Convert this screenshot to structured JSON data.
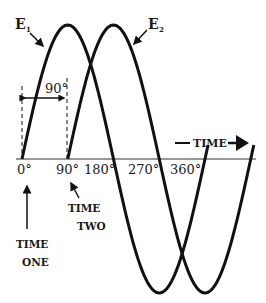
{
  "diagram": {
    "colors": {
      "line": "#111111",
      "background": "#ffffff"
    },
    "waves": [
      {
        "name": "E1",
        "label_main": "E",
        "label_sub": "1",
        "start_deg": 0
      },
      {
        "name": "E2",
        "label_main": "E",
        "label_sub": "2",
        "start_deg": 90
      }
    ],
    "phase_marker": {
      "label": "90°"
    },
    "axis": {
      "ticks": [
        "0°",
        "90°",
        "180°",
        "270°",
        "360°"
      ],
      "direction_label": "TIME"
    },
    "annotations": {
      "time_one": [
        "TIME",
        "ONE"
      ],
      "time_two": [
        "TIME",
        "TWO"
      ]
    }
  }
}
